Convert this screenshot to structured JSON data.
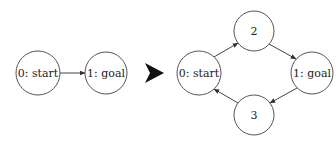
{
  "diagram": {
    "before": {
      "nodes": [
        {
          "id": "0",
          "label": "0: start"
        },
        {
          "id": "1",
          "label": "1: goal"
        }
      ],
      "edges": [
        {
          "from": "0",
          "to": "1"
        }
      ]
    },
    "transition_icon": "right-arrowhead-icon",
    "after": {
      "nodes": [
        {
          "id": "0",
          "label": "0: start"
        },
        {
          "id": "2",
          "label": "2"
        },
        {
          "id": "1",
          "label": "1: goal"
        },
        {
          "id": "3",
          "label": "3"
        }
      ],
      "edges": [
        {
          "from": "0",
          "to": "2"
        },
        {
          "from": "2",
          "to": "1"
        },
        {
          "from": "1",
          "to": "3"
        },
        {
          "from": "3",
          "to": "0"
        }
      ]
    },
    "colors": {
      "node_stroke": "#555555",
      "edge": "#444444",
      "arrow": "#111111",
      "background": "#ffffff"
    }
  }
}
